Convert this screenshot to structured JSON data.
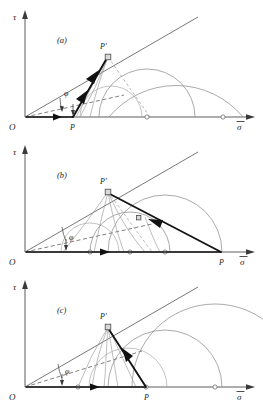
{
  "figure": {
    "kind": "mohr-circle-diagram",
    "width": 263,
    "height": 405,
    "background": "#ffffff",
    "line_color": "#141414",
    "arc_color": "#8e8e8e",
    "axis_color": "#4a4a4a"
  },
  "panels": [
    {
      "id": "a",
      "label": "(a)",
      "label_pos": [
        62,
        40
      ],
      "axes": {
        "origin": [
          25,
          117
        ],
        "y_axis_label": "τ",
        "y_axis_label_pos": [
          14,
          17
        ],
        "y_axis_top": [
          25,
          12
        ],
        "x_axis_label": "σ",
        "x_axis_label_pos": [
          240,
          128
        ],
        "x_axis_right": [
          256,
          117
        ],
        "x_axis_label_overbar": true
      },
      "origin_label": "O",
      "origin_label_pos": [
        12,
        127
      ],
      "points": [
        {
          "name": "P",
          "label": "P",
          "pos": [
            73,
            117
          ],
          "label_pos": [
            70,
            128
          ],
          "marker": "none"
        },
        {
          "name": "P-prime",
          "label": "P'",
          "pos": [
            108,
            57
          ],
          "label_pos": [
            100,
            47
          ],
          "marker": "square"
        }
      ],
      "angle": {
        "label": "φ",
        "label_pos": [
          65,
          93
        ],
        "vertex": [
          25,
          117
        ]
      },
      "envelope_end": [
        196,
        18
      ],
      "dashed_line_end": [
        120,
        98
      ],
      "circles": [
        {
          "center": [
            147,
            117
          ],
          "radius": 48
        },
        {
          "center": [
            111,
            117
          ],
          "radius": 31
        },
        {
          "center": [
            196,
            117
          ],
          "radius": 87
        }
      ],
      "circle_center_markers": [
        [
          147,
          117
        ],
        [
          196,
          117
        ]
      ],
      "thick_path": [
        [
          25,
          117
        ],
        [
          73,
          117
        ],
        [
          108,
          57
        ]
      ],
      "arrow_positions": [
        "on-sigma-axis",
        "toward-P-prime"
      ]
    },
    {
      "id": "b",
      "label": "(b)",
      "label_pos": [
        62,
        40
      ],
      "axes": {
        "origin": [
          25,
          117
        ],
        "y_axis_label": "τ",
        "y_axis_label_pos": [
          14,
          17
        ],
        "y_axis_top": [
          25,
          12
        ],
        "x_axis_label": "σ",
        "x_axis_label_pos": [
          243,
          128
        ],
        "x_axis_right": [
          256,
          117
        ],
        "x_axis_label_overbar": true
      },
      "origin_label": "O",
      "origin_label_pos": [
        12,
        127
      ],
      "points": [
        {
          "name": "P",
          "label": "P",
          "pos": [
            221,
            117
          ],
          "label_pos": [
            221,
            128
          ],
          "marker": "none"
        },
        {
          "name": "P-prime",
          "label": "P'",
          "pos": [
            108,
            57
          ],
          "label_pos": [
            100,
            47
          ],
          "marker": "square"
        }
      ],
      "angle": {
        "label": "φ",
        "label_pos": [
          68,
          105
        ],
        "vertex": [
          25,
          117
        ]
      },
      "envelope_end": [
        196,
        18
      ],
      "dashed_line_end": [
        150,
        90
      ],
      "circles": [
        {
          "center": [
            165,
            117
          ],
          "radius": 57
        },
        {
          "center": [
            130,
            117
          ],
          "radius": 40
        },
        {
          "center": [
            90,
            117
          ],
          "radius": 29
        }
      ],
      "circle_center_markers": [
        [
          165,
          117
        ],
        [
          130,
          117
        ],
        [
          90,
          117
        ]
      ],
      "thick_path": [
        [
          25,
          117
        ],
        [
          221,
          117
        ],
        [
          108,
          57
        ]
      ],
      "arrow_positions": [
        "on-sigma-axis",
        "toward-P-prime"
      ]
    },
    {
      "id": "c",
      "label": "(c)",
      "label_pos": [
        62,
        40
      ],
      "axes": {
        "origin": [
          25,
          117
        ],
        "y_axis_label": "τ",
        "y_axis_label_pos": [
          14,
          17
        ],
        "y_axis_top": [
          25,
          12
        ],
        "x_axis_label": "σ",
        "x_axis_label_pos": [
          240,
          128
        ],
        "x_axis_right": [
          256,
          117
        ],
        "x_axis_label_overbar": true
      },
      "origin_label": "O",
      "origin_label_pos": [
        12,
        127
      ],
      "points": [
        {
          "name": "P",
          "label": "P",
          "pos": [
            146,
            117
          ],
          "label_pos": [
            146,
            128
          ],
          "marker": "open"
        },
        {
          "name": "P-prime",
          "label": "P'",
          "pos": [
            108,
            57
          ],
          "label_pos": [
            100,
            47
          ],
          "marker": "square"
        }
      ],
      "angle": {
        "label": "φ",
        "label_pos": [
          66,
          100
        ],
        "vertex": [
          25,
          117
        ]
      },
      "envelope_end": [
        196,
        18
      ],
      "dashed_line_end": [
        140,
        82
      ],
      "circles": [
        {
          "center": [
            128,
            117
          ],
          "radius": 39
        },
        {
          "center": [
            165,
            117
          ],
          "radius": 57
        },
        {
          "center": [
            215,
            117
          ],
          "radius": 83
        }
      ],
      "circle_center_markers": [
        [
          78,
          117
        ],
        [
          215,
          117
        ]
      ],
      "thick_path": [
        [
          25,
          117
        ],
        [
          146,
          117
        ],
        [
          108,
          57
        ]
      ],
      "arrow_positions": [
        "on-sigma-axis",
        "toward-P-prime"
      ]
    }
  ]
}
